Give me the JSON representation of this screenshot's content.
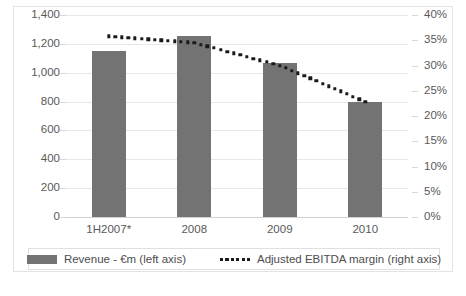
{
  "chart_data": {
    "type": "bar",
    "title": "",
    "subtitle": "",
    "xlabel": "",
    "ylabel": "",
    "categories": [
      "1H2007*",
      "2008",
      "2009",
      "2010"
    ],
    "grid": true,
    "legend_position": "bottom",
    "left_axis": {
      "label": "Revenue - €m (left axis)",
      "ylim": [
        0,
        1400
      ],
      "tick_step": 200,
      "ticks": [
        "0",
        "200",
        "400",
        "600",
        "800",
        "1,000",
        "1,200",
        "1,400"
      ],
      "tick_values": [
        0,
        200,
        400,
        600,
        800,
        1000,
        1200,
        1400
      ]
    },
    "right_axis": {
      "label": "Adjusted EBITDA margin (right axis)",
      "ylim": [
        0,
        40
      ],
      "tick_step": 5,
      "ticks": [
        "0%",
        "5%",
        "10%",
        "15%",
        "20%",
        "25%",
        "30%",
        "35%",
        "40%"
      ],
      "tick_values": [
        0,
        5,
        10,
        15,
        20,
        25,
        30,
        35,
        40
      ]
    },
    "series": [
      {
        "name": "Revenue - €m (left axis)",
        "type": "bar",
        "axis": "left",
        "color": "#737373",
        "values": [
          1150,
          1255,
          1070,
          800
        ]
      },
      {
        "name": "Adjusted EBITDA margin (right axis)",
        "type": "line",
        "style": "dotted",
        "axis": "right",
        "color": "#1a1a1a",
        "values": [
          35.8,
          34.5,
          30.0,
          22.8
        ]
      }
    ]
  },
  "legend": {
    "items": [
      {
        "label": "Revenue - €m (left axis)",
        "marker": "bar-swatch",
        "color": "#737373"
      },
      {
        "label": "Adjusted EBITDA margin (right axis)",
        "marker": "dotted-line-swatch",
        "color": "#1a1a1a"
      }
    ]
  },
  "colors": {
    "bar": "#737373",
    "dots": "#1a1a1a",
    "gridline": "#e8e8e8",
    "axis_text": "#595959",
    "card_border": "#e3e3e3",
    "background": "#ffffff"
  }
}
